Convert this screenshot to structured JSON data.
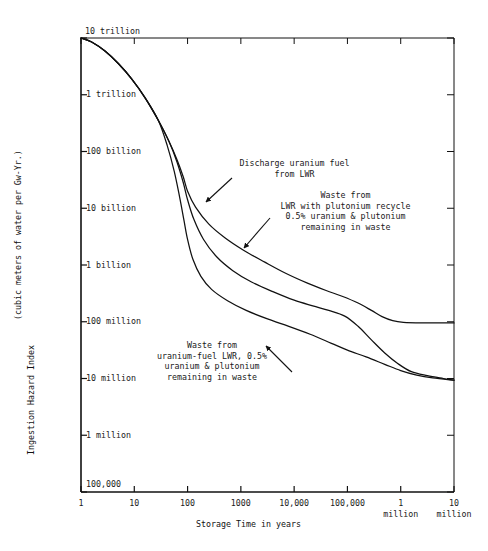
{
  "figure": {
    "background": "#ffffff",
    "ink": "#111111"
  },
  "axes": {
    "x_title": "Storage Time in years",
    "y_title_line1": "Ingestion Hazard Index",
    "y_title_line2": "(cubic meters of water per Gw-Yr.)",
    "x_ticks": [
      {
        "label": "1",
        "value": 0
      },
      {
        "label": "10",
        "value": 1
      },
      {
        "label": "100",
        "value": 2
      },
      {
        "label": "1000",
        "value": 3
      },
      {
        "label": "10,000",
        "value": 4
      },
      {
        "label": "100,000",
        "value": 5
      },
      {
        "label": "1\nmillion",
        "value": 6
      },
      {
        "label": "10\nmillion",
        "value": 7
      }
    ],
    "y_ticks": [
      {
        "label": "10 trillion",
        "value": 13
      },
      {
        "label": "1 trillion",
        "value": 12
      },
      {
        "label": "100 billion",
        "value": 11
      },
      {
        "label": "10 billion",
        "value": 10
      },
      {
        "label": "1 billion",
        "value": 9
      },
      {
        "label": "100 million",
        "value": 8
      },
      {
        "label": "10 million",
        "value": 7
      },
      {
        "label": "1 million",
        "value": 6
      },
      {
        "label": "100,000",
        "value": 5
      }
    ]
  },
  "annotations": [
    {
      "id": "discharge-uranium-fuel",
      "lines": [
        "Discharge uranium fuel",
        "from LWR"
      ],
      "text": "Discharge uranium fuel\nfrom LWR"
    },
    {
      "id": "waste-plutonium-recycle",
      "lines": [
        "Waste from",
        "LWR with plutonium recycle",
        "0.5% uranium & plutonium",
        "remaining in waste"
      ],
      "text": "Waste from\nLWR with plutonium recycle\n0.5% uranium & plutonium\nremaining in waste"
    },
    {
      "id": "waste-uranium-fuel",
      "lines": [
        "Waste from",
        "uranium-fuel LWR, 0.5%",
        "uranium & plutonium",
        "remaining in waste"
      ],
      "text": "Waste from\nuranium-fuel LWR, 0.5%\nuranium & plutonium\nremaining in waste"
    }
  ],
  "chart_data": {
    "type": "line",
    "title": "",
    "xlabel": "Storage Time in years",
    "ylabel": "Ingestion Hazard Index (cubic meters of water per Gw-Yr.)",
    "xscale": "log",
    "yscale": "log",
    "xlim": [
      1,
      10000000
    ],
    "ylim": [
      100000,
      10000000000000
    ],
    "grid": false,
    "legend": "annotations-on-plot",
    "xtick_labels": [
      "1",
      "10",
      "100",
      "1000",
      "10,000",
      "100,000",
      "1 million",
      "10 million"
    ],
    "ytick_labels": [
      "100,000",
      "1 million",
      "10 million",
      "100 million",
      "1 billion",
      "10 billion",
      "100 billion",
      "1 trillion",
      "10 trillion"
    ],
    "series": [
      {
        "name": "Discharge uranium fuel from LWR",
        "points_log": [
          [
            0.0,
            13.0
          ],
          [
            0.2,
            12.93
          ],
          [
            0.45,
            12.77
          ],
          [
            0.7,
            12.55
          ],
          [
            0.95,
            12.28
          ],
          [
            1.2,
            11.95
          ],
          [
            1.45,
            11.55
          ],
          [
            1.65,
            11.18
          ],
          [
            1.8,
            10.86
          ],
          [
            1.92,
            10.55
          ],
          [
            2.0,
            10.3
          ],
          [
            2.15,
            10.02
          ],
          [
            2.4,
            9.72
          ],
          [
            2.7,
            9.48
          ],
          [
            3.05,
            9.26
          ],
          [
            3.45,
            9.05
          ],
          [
            3.85,
            8.85
          ],
          [
            4.25,
            8.68
          ],
          [
            4.6,
            8.55
          ],
          [
            4.9,
            8.45
          ],
          [
            5.2,
            8.33
          ],
          [
            5.45,
            8.2
          ],
          [
            5.65,
            8.09
          ],
          [
            5.85,
            8.02
          ],
          [
            6.05,
            7.99
          ],
          [
            6.4,
            7.98
          ],
          [
            7.0,
            7.98
          ]
        ]
      },
      {
        "name": "Waste from LWR with plutonium recycle, 0.5% uranium & plutonium remaining in waste",
        "points_log": [
          [
            0.0,
            13.0
          ],
          [
            0.2,
            12.93
          ],
          [
            0.45,
            12.77
          ],
          [
            0.7,
            12.55
          ],
          [
            0.95,
            12.28
          ],
          [
            1.2,
            11.95
          ],
          [
            1.45,
            11.55
          ],
          [
            1.65,
            11.18
          ],
          [
            1.8,
            10.82
          ],
          [
            1.92,
            10.45
          ],
          [
            2.0,
            10.15
          ],
          [
            2.12,
            9.8
          ],
          [
            2.3,
            9.45
          ],
          [
            2.55,
            9.14
          ],
          [
            2.85,
            8.9
          ],
          [
            3.2,
            8.7
          ],
          [
            3.6,
            8.53
          ],
          [
            4.0,
            8.38
          ],
          [
            4.35,
            8.28
          ],
          [
            4.65,
            8.2
          ],
          [
            4.95,
            8.1
          ],
          [
            5.2,
            7.92
          ],
          [
            5.45,
            7.68
          ],
          [
            5.7,
            7.45
          ],
          [
            5.95,
            7.26
          ],
          [
            6.2,
            7.12
          ],
          [
            6.5,
            7.05
          ],
          [
            6.8,
            7.0
          ],
          [
            7.0,
            6.97
          ]
        ]
      },
      {
        "name": "Waste from uranium-fuel LWR, 0.5% uranium & plutonium remaining in waste",
        "points_log": [
          [
            0.0,
            13.0
          ],
          [
            0.2,
            12.93
          ],
          [
            0.45,
            12.77
          ],
          [
            0.7,
            12.55
          ],
          [
            0.95,
            12.28
          ],
          [
            1.2,
            11.95
          ],
          [
            1.45,
            11.55
          ],
          [
            1.62,
            11.1
          ],
          [
            1.75,
            10.65
          ],
          [
            1.85,
            10.2
          ],
          [
            1.93,
            9.8
          ],
          [
            2.0,
            9.45
          ],
          [
            2.1,
            9.1
          ],
          [
            2.25,
            8.8
          ],
          [
            2.45,
            8.57
          ],
          [
            2.75,
            8.37
          ],
          [
            3.1,
            8.2
          ],
          [
            3.5,
            8.05
          ],
          [
            3.9,
            7.92
          ],
          [
            4.3,
            7.78
          ],
          [
            4.7,
            7.62
          ],
          [
            5.0,
            7.5
          ],
          [
            5.35,
            7.38
          ],
          [
            5.7,
            7.25
          ],
          [
            6.0,
            7.14
          ],
          [
            6.3,
            7.06
          ],
          [
            6.6,
            7.01
          ],
          [
            7.0,
            6.97
          ]
        ]
      }
    ]
  },
  "geometry": {
    "plot_left": 81,
    "plot_right": 454,
    "plot_top": 38,
    "plot_bottom": 492,
    "x_decades": 7,
    "y_decades": 8
  }
}
